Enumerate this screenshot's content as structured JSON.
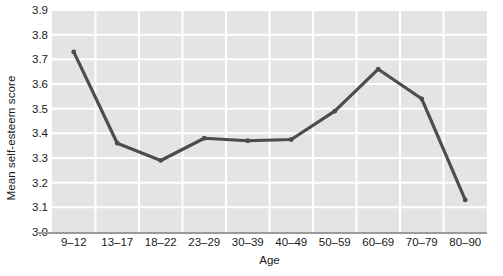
{
  "chart_data": {
    "type": "line",
    "title": "",
    "xlabel": "Age",
    "ylabel": "Mean self-esteem score",
    "categories": [
      "9–12",
      "13–17",
      "18–22",
      "23–29",
      "30–39",
      "40–49",
      "50–59",
      "60–69",
      "70–79",
      "80–90"
    ],
    "values": [
      3.73,
      3.36,
      3.29,
      3.38,
      3.37,
      3.375,
      3.49,
      3.66,
      3.54,
      3.13
    ],
    "ylim": [
      3.0,
      3.9
    ],
    "yticks": [
      "3.0",
      "3.1",
      "3.2",
      "3.3",
      "3.4",
      "3.5",
      "3.6",
      "3.7",
      "3.8",
      "3.9"
    ],
    "ytick_values": [
      3.0,
      3.1,
      3.2,
      3.3,
      3.4,
      3.5,
      3.6,
      3.7,
      3.8,
      3.9
    ],
    "grid": true,
    "grid_color": "#ffffff",
    "plot_background": "#e4e4e4",
    "legend": "none",
    "series": [
      {
        "name": "Mean self-esteem score",
        "color": "#4d4d4d",
        "marker": "dot",
        "values": [
          3.73,
          3.36,
          3.29,
          3.38,
          3.37,
          3.375,
          3.49,
          3.66,
          3.54,
          3.13
        ]
      }
    ]
  }
}
